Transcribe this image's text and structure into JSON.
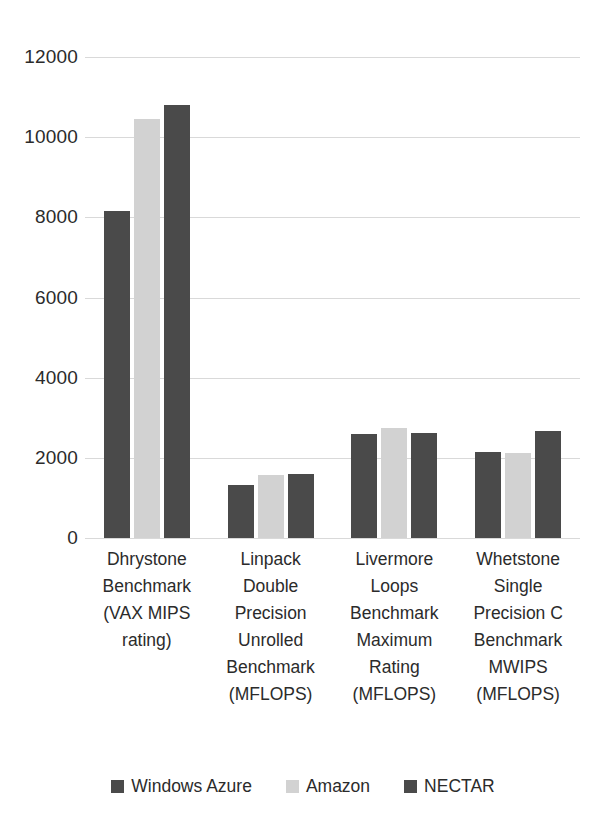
{
  "chart_data": {
    "type": "bar",
    "title": "",
    "xlabel": "",
    "ylabel": "",
    "ylim": [
      0,
      12000
    ],
    "ytick_step": 2000,
    "yticks": [
      "12000",
      "10000",
      "8000",
      "6000",
      "4000",
      "2000",
      "0"
    ],
    "grid": true,
    "legend_position": "bottom",
    "categories": [
      "Dhrystone Benchmark (VAX MIPS rating)",
      "Linpack Double Precision Unrolled Benchmark (MFLOPS)",
      "Livermore Loops Benchmark Maximum Rating (MFLOPS)",
      "Whetstone Single Precision C Benchmark MWIPS (MFLOPS)"
    ],
    "category_lines": [
      [
        "Dhrystone",
        "Benchmark",
        "(VAX MIPS",
        "rating)"
      ],
      [
        "Linpack",
        "Double",
        "Precision",
        "Unrolled",
        "Benchmark",
        "(MFLOPS)"
      ],
      [
        "Livermore",
        "Loops",
        "Benchmark",
        "Maximum",
        "Rating",
        "(MFLOPS)"
      ],
      [
        "Whetstone",
        "Single",
        "Precision C",
        "Benchmark",
        "MWIPS",
        "(MFLOPS)"
      ]
    ],
    "series": [
      {
        "name": "Windows Azure",
        "color": "#4a4a4a",
        "values": [
          8150,
          1330,
          2600,
          2150
        ]
      },
      {
        "name": "Amazon",
        "color": "#d2d2d2",
        "values": [
          10450,
          1560,
          2750,
          2130
        ]
      },
      {
        "name": "NECTAR",
        "color": "#4a4a4a",
        "values": [
          10800,
          1600,
          2620,
          2680
        ]
      }
    ]
  },
  "legend": {
    "items": [
      {
        "label": "Windows Azure",
        "color": "#4a4a4a",
        "icon": "square-swatch-icon"
      },
      {
        "label": "Amazon",
        "color": "#d2d2d2",
        "icon": "square-swatch-icon"
      },
      {
        "label": "NECTAR",
        "color": "#4a4a4a",
        "icon": "square-swatch-icon"
      }
    ]
  }
}
